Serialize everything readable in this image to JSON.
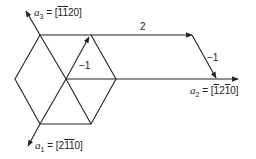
{
  "diagram": {
    "type": "hexagonal-lattice-vectors",
    "axes": [
      {
        "id": "a1",
        "symbol": "a",
        "sub": "1",
        "index_parts": [
          {
            "t": "2",
            "bar": false
          },
          {
            "t": "1",
            "bar": true
          },
          {
            "t": "1",
            "bar": true
          },
          {
            "t": "0",
            "bar": false
          }
        ],
        "text": "a1 = [2-1-10]"
      },
      {
        "id": "a2",
        "symbol": "a",
        "sub": "2",
        "index_parts": [
          {
            "t": "1",
            "bar": true
          },
          {
            "t": "2",
            "bar": false
          },
          {
            "t": "1",
            "bar": true
          },
          {
            "t": "0",
            "bar": false
          }
        ],
        "text": "a2 = [-12-10]"
      },
      {
        "id": "a3",
        "symbol": "a",
        "sub": "3",
        "index_parts": [
          {
            "t": "1",
            "bar": true
          },
          {
            "t": "1",
            "bar": true
          },
          {
            "t": "2",
            "bar": false
          },
          {
            "t": "0",
            "bar": false
          }
        ],
        "text": "a3 = [-1-120]"
      }
    ],
    "vector_labels": {
      "inner": "−1",
      "top": "2",
      "right": "−1"
    },
    "eq": "=",
    "colors": {
      "line": "#222222",
      "background": "#ffffff"
    }
  }
}
